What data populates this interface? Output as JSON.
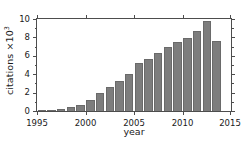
{
  "chart_data": {
    "type": "bar",
    "title": "",
    "xlabel": "year",
    "ylabel": "citations ×10",
    "ylabel_exponent": "3",
    "ylabel_full": "citations ×10^3",
    "categories": [
      1995,
      1996,
      1997,
      1998,
      1999,
      2000,
      2001,
      2002,
      2003,
      2004,
      2005,
      2006,
      2007,
      2008,
      2009,
      2010,
      2011,
      2012,
      2013
    ],
    "values": [
      0.05,
      0.15,
      0.2,
      0.45,
      0.65,
      1.2,
      1.95,
      2.65,
      3.3,
      4.05,
      5.25,
      5.6,
      6.3,
      7.0,
      7.45,
      7.95,
      8.65,
      9.8,
      7.6
    ],
    "xlim": [
      1995,
      2015
    ],
    "ylim": [
      0,
      10
    ],
    "xticks": [
      1995,
      2000,
      2005,
      2010,
      2015
    ],
    "xtick_labels": [
      "1995",
      "2000",
      "2005",
      "2010",
      "2015"
    ],
    "yticks": [
      0,
      2,
      4,
      6,
      8,
      10
    ],
    "ytick_labels": [
      "0",
      "2",
      "4",
      "6",
      "8",
      "10"
    ],
    "yticks_minor": [
      1,
      3,
      5,
      7,
      9
    ],
    "grid": false,
    "legend": false,
    "bar_color": "#7d7d7d",
    "bar_edge_color": "#6a6a6a",
    "axis_color": "#4d4d4d",
    "text_color": "#1a1a1a",
    "background": "#ffffff"
  }
}
